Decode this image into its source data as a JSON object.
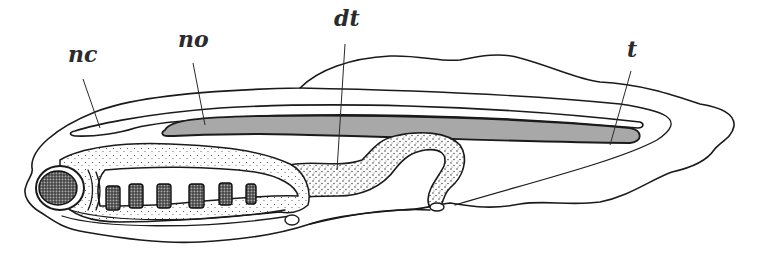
{
  "figure": {
    "type": "anatomical line drawing",
    "colors": {
      "line": "#1a1a1a",
      "notochord_fill": "#a8a8a8",
      "background": "#ffffff",
      "label": "#2b2b2b"
    },
    "labels": [
      {
        "id": "nc",
        "text": "nc",
        "x": 68,
        "y": 43
      },
      {
        "id": "no",
        "text": "no",
        "x": 178,
        "y": 28
      },
      {
        "id": "dt",
        "text": "dt",
        "x": 334,
        "y": 7
      },
      {
        "id": "t",
        "text": "t",
        "x": 627,
        "y": 38
      }
    ],
    "gill_slit_count": 6
  }
}
